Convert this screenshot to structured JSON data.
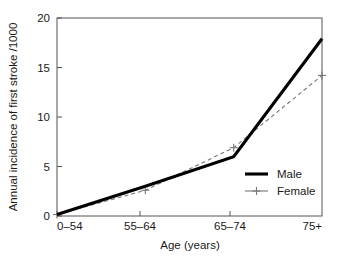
{
  "chart_data": {
    "type": "line",
    "title": "",
    "xlabel": "Age (years)",
    "ylabel": "Annual incidence of first stroke /1000",
    "categories": [
      "0–54",
      "55–64",
      "65–74",
      "75+"
    ],
    "xtick_labels": [
      "0–54",
      "55–64",
      "65–74",
      "75+"
    ],
    "ytick_labels": [
      "0",
      "5",
      "10",
      "15",
      "20"
    ],
    "ytick_values": [
      0,
      5,
      10,
      15,
      20
    ],
    "ylim": [
      0,
      20
    ],
    "xlim": [
      0,
      3
    ],
    "grid": false,
    "legend_position": "lower right inside",
    "series": [
      {
        "name": "Male",
        "values": [
          0.15,
          3.0,
          6.0,
          17.9
        ],
        "style": "solid",
        "color": "#000000",
        "width": "thick",
        "marker": "none"
      },
      {
        "name": "Female",
        "values": [
          0.15,
          2.6,
          6.9,
          14.2
        ],
        "style": "dashed",
        "color": "#777777",
        "width": "thin",
        "marker": "plus"
      }
    ]
  },
  "legend": {
    "entries": [
      {
        "label": "Male"
      },
      {
        "label": "Female"
      }
    ]
  },
  "axes": {
    "y_title": "Annual incidence of first stroke /1000",
    "x_title": "Age (years)",
    "y_ticks": [
      {
        "label": "20"
      },
      {
        "label": "15"
      },
      {
        "label": "10"
      },
      {
        "label": "5"
      },
      {
        "label": "0"
      }
    ],
    "x_ticks": [
      {
        "label": "0–54"
      },
      {
        "label": "55–64"
      },
      {
        "label": "65–74"
      },
      {
        "label": "75+"
      }
    ]
  },
  "colors": {
    "male_line": "#000000",
    "female_line": "#777777",
    "axis": "#555555",
    "background": "#ffffff",
    "text": "#1a1a1a"
  }
}
